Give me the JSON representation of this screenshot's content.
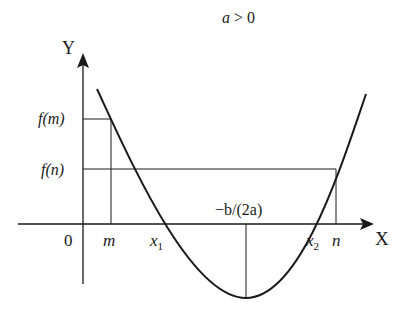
{
  "title": "a > 0",
  "axes": {
    "x_label": "X",
    "y_label": "Y",
    "origin_label": "0"
  },
  "y_ticks": {
    "fm": "f(m)",
    "fn": "f(n)"
  },
  "x_ticks": {
    "m": "m",
    "x1": "x",
    "x1_sub": "1",
    "axis_of_symmetry": "−b/(2a)",
    "x2": "x",
    "x2_sub": "2",
    "n": "n"
  },
  "colors": {
    "stroke": "#1a1a1a",
    "background": "#ffffff"
  },
  "geometry": {
    "origin": [
      83,
      224
    ],
    "x_axis_start": 18,
    "x_axis_end": 372,
    "y_axis_top": 54,
    "y_axis_bottom": 284,
    "vertex": [
      246,
      298
    ],
    "curve_left_end": [
      97,
      89
    ],
    "curve_right_end": [
      366,
      94
    ],
    "m_x": 111,
    "fm_y": 119,
    "n_x": 336,
    "fn_y": 169,
    "x1_x": 168,
    "x2_x": 311
  }
}
